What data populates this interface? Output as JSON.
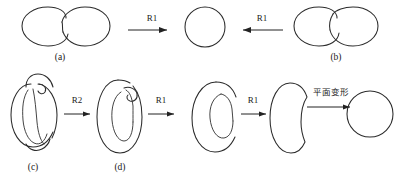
{
  "figure": {
    "title_fragment": "",
    "background_color": "#ffffff",
    "stroke_color": "#2b2b2b",
    "top_row": {
      "left_diagram": {
        "name": "two-tangent-circles-lower-crossing",
        "caption": "(a)"
      },
      "center_diagram": {
        "name": "single-circle-unknot",
        "caption": ""
      },
      "right_diagram": {
        "name": "two-tangent-circles-upper-crossing",
        "caption": "(b)"
      },
      "arrows": [
        {
          "name": "arrow-left-to-center",
          "label": "R1",
          "direction": "right"
        },
        {
          "name": "arrow-right-to-center",
          "label": "R1",
          "direction": "left"
        }
      ]
    },
    "bottom_row": {
      "steps": [
        {
          "name": "knotted-oval-with-double-loop",
          "caption": "(c)"
        },
        {
          "name": "oval-with-hooked-inner-loop",
          "caption": "(d)"
        },
        {
          "name": "c-shape-with-inner-curl",
          "caption": ""
        },
        {
          "name": "thick-c-shape",
          "caption": ""
        },
        {
          "name": "plain-circle",
          "caption": ""
        }
      ],
      "arrows": [
        {
          "name": "arrow-c-to-d",
          "label": "R2",
          "direction": "right"
        },
        {
          "name": "arrow-d-to-e",
          "label": "R1",
          "direction": "right"
        },
        {
          "name": "arrow-e-to-f",
          "label": "R1",
          "direction": "right"
        },
        {
          "name": "arrow-f-to-g",
          "label": "平面变形",
          "direction": "right"
        }
      ]
    }
  }
}
